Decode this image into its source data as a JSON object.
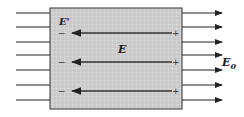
{
  "diagram": {
    "labels": {
      "induced_field": "E'",
      "net_field": "E",
      "external_field": "E",
      "external_field_sub": "0"
    },
    "signs": {
      "negative": "−",
      "positive": "+"
    },
    "colors": {
      "slab_fill": "#c9c9c9",
      "grid": "#e4e4e4",
      "lines": "#222222"
    },
    "external_field_lines": 7,
    "internal_arrows": 3
  }
}
